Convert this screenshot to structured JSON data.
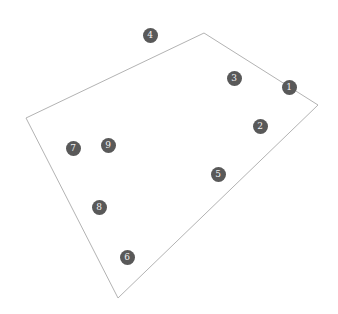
{
  "diagram": {
    "polygon": {
      "stroke": "#b3b3b3",
      "points": [
        [
          26,
          118
        ],
        [
          204,
          33
        ],
        [
          318,
          105
        ],
        [
          118,
          298
        ]
      ]
    },
    "marker_color": "#595959",
    "markers": [
      {
        "label": "4",
        "x": 150,
        "y": 35
      },
      {
        "label": "3",
        "x": 234,
        "y": 78
      },
      {
        "label": "1",
        "x": 289,
        "y": 87
      },
      {
        "label": "2",
        "x": 260,
        "y": 126
      },
      {
        "label": "7",
        "x": 73,
        "y": 148
      },
      {
        "label": "9",
        "x": 108,
        "y": 145
      },
      {
        "label": "5",
        "x": 218,
        "y": 174
      },
      {
        "label": "8",
        "x": 99,
        "y": 207
      },
      {
        "label": "6",
        "x": 127,
        "y": 257
      }
    ]
  }
}
